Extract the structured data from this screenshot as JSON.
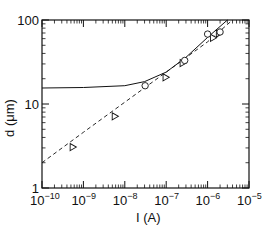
{
  "chart_data": {
    "type": "scatter",
    "title": "",
    "xlabel": "I (A)",
    "ylabel": "d (μm)",
    "xscale": "log",
    "yscale": "log",
    "xlim": [
      1e-10,
      1e-05
    ],
    "ylim": [
      1,
      100
    ],
    "grid": false,
    "legend": null,
    "x_ticks": [
      {
        "base": "10",
        "exp": "−10",
        "value": 1e-10
      },
      {
        "base": "10",
        "exp": "−9",
        "value": 1e-09
      },
      {
        "base": "10",
        "exp": "−8",
        "value": 1e-08
      },
      {
        "base": "10",
        "exp": "−7",
        "value": 1e-07
      },
      {
        "base": "10",
        "exp": "−6",
        "value": 1e-06
      },
      {
        "base": "10",
        "exp": "−5",
        "value": 1e-05
      }
    ],
    "y_ticks": [
      {
        "label": "1",
        "value": 1
      },
      {
        "label": "10",
        "value": 10
      },
      {
        "label": "100",
        "value": 100
      }
    ],
    "series": [
      {
        "name": "triangles",
        "marker": "triangle-open",
        "points": [
          {
            "x": 5.3e-10,
            "y": 3.1
          },
          {
            "x": 5.5e-09,
            "y": 7.2
          },
          {
            "x": 9.3e-08,
            "y": 21
          },
          {
            "x": 2.4e-07,
            "y": 31
          },
          {
            "x": 1.3e-06,
            "y": 62
          },
          {
            "x": 1.8e-06,
            "y": 70
          }
        ]
      },
      {
        "name": "circles",
        "marker": "circle-open",
        "points": [
          {
            "x": 3.1e-08,
            "y": 16.5
          },
          {
            "x": 2.8e-07,
            "y": 33
          },
          {
            "x": 1e-06,
            "y": 68
          },
          {
            "x": 2e-06,
            "y": 72
          }
        ]
      },
      {
        "name": "dashed-fit",
        "style": "dashed",
        "x": [
          1e-10,
          1e-09,
          1e-08,
          1e-07,
          1e-06,
          4e-06
        ],
        "y": [
          2.0,
          4.6,
          10.5,
          24,
          55,
          100
        ]
      },
      {
        "name": "solid-fit",
        "style": "solid",
        "x": [
          1e-10,
          1e-09,
          1e-08,
          3e-08,
          1e-07,
          3e-07,
          1e-06,
          3e-06
        ],
        "y": [
          15.5,
          15.7,
          16.5,
          18.5,
          24,
          36,
          62,
          100
        ]
      }
    ]
  }
}
